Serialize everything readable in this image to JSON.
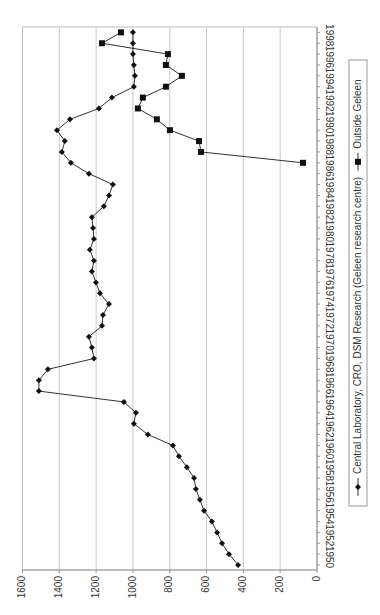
{
  "chart_data": {
    "type": "line",
    "orientation": "rotated-90-clockwise",
    "title": "",
    "xlabel": "",
    "ylabel": "",
    "ylim": [
      0,
      1600
    ],
    "yticks": [
      0,
      200,
      400,
      600,
      800,
      1000,
      1200,
      1400,
      1600
    ],
    "xlim": [
      1950,
      1999
    ],
    "xtick_labels": [
      "1950",
      "1952",
      "1954",
      "1956",
      "1958",
      "1960",
      "1962",
      "1964",
      "1966",
      "1968",
      "1970",
      "1972",
      "1974",
      "1976",
      "1978",
      "1980",
      "1982",
      "1984",
      "1986",
      "1988",
      "1990",
      "1992",
      "1994",
      "1996",
      "1998"
    ],
    "grid": true,
    "legend_position": "right (bottom after rotation)",
    "series": [
      {
        "name": "Central Laboratory, CRO, DSM Research (Geleen research centre)",
        "marker": "diamond",
        "x": [
          1950,
          1951,
          1952,
          1953,
          1954,
          1955,
          1956,
          1957,
          1958,
          1959,
          1960,
          1961,
          1962,
          1963,
          1964,
          1965,
          1966,
          1967,
          1968,
          1969,
          1970,
          1971,
          1972,
          1973,
          1974,
          1975,
          1976,
          1977,
          1978,
          1979,
          1980,
          1981,
          1982,
          1983,
          1984,
          1985,
          1986,
          1987,
          1988,
          1989,
          1990,
          1991,
          1992,
          1993,
          1994,
          1995,
          1996,
          1997,
          1998,
          1999
        ],
        "values": [
          429,
          478,
          516,
          543,
          571,
          614,
          636,
          658,
          668,
          707,
          750,
          783,
          919,
          995,
          984,
          1049,
          1511,
          1511,
          1462,
          1212,
          1223,
          1239,
          1168,
          1163,
          1130,
          1179,
          1201,
          1223,
          1212,
          1234,
          1212,
          1217,
          1223,
          1158,
          1130,
          1109,
          1239,
          1337,
          1386,
          1370,
          1413,
          1342,
          1185,
          1114,
          995,
          989,
          995,
          1000,
          1000,
          1000
        ]
      },
      {
        "name": "Outside Geleen",
        "marker": "square",
        "x": [
          1987,
          1988,
          1989,
          1990,
          1991,
          1992,
          1993,
          1994,
          1995,
          1996,
          1997,
          1998,
          1999
        ],
        "values": [
          76,
          630,
          641,
          799,
          870,
          973,
          946,
          821,
          734,
          821,
          810,
          1168,
          1065
        ]
      }
    ]
  },
  "colors": {
    "line": "#333333",
    "marker": "#111111",
    "grid": "#c8c8c8",
    "axis": "#9a9a9a",
    "plot_border": "#bdbdbd",
    "legend_border": "#9a9a9a"
  }
}
